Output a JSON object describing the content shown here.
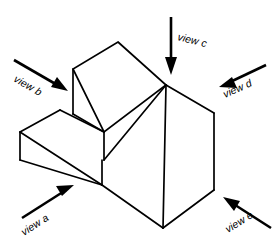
{
  "figure": {
    "background_color": "#ffffff",
    "line_color": "#000000",
    "canvas": {
      "width": 278,
      "height": 249
    }
  },
  "labels": {
    "view_a": "view a",
    "view_b": "view b",
    "view_c": "view c",
    "view_d": "view d",
    "view_e": "view e"
  },
  "arrows": [
    {
      "id": "view-a",
      "label": "view a",
      "direction": "up-right",
      "tail": {
        "x": 22,
        "y": 218
      },
      "tip": {
        "x": 72,
        "y": 186
      },
      "label_rotation_deg": -33,
      "label_x": 24,
      "label_y": 236
    },
    {
      "id": "view-b",
      "label": "view b",
      "direction": "down-right",
      "tail": {
        "x": 14,
        "y": 60
      },
      "tip": {
        "x": 66,
        "y": 90
      },
      "label_rotation_deg": 30,
      "label_x": 13,
      "label_y": 81
    },
    {
      "id": "view-c",
      "label": "view c",
      "direction": "down",
      "tail": {
        "x": 171,
        "y": 17
      },
      "tip": {
        "x": 171,
        "y": 72
      },
      "label_rotation_deg": 14,
      "label_x": 177,
      "label_y": 40
    },
    {
      "id": "view-d",
      "label": "view d",
      "direction": "down-left",
      "tail": {
        "x": 266,
        "y": 65
      },
      "tip": {
        "x": 221,
        "y": 86
      },
      "label_rotation_deg": -24,
      "label_x": 225,
      "label_y": 98
    },
    {
      "id": "view-e",
      "label": "view e",
      "direction": "up-left",
      "tail": {
        "x": 271,
        "y": 228
      },
      "tip": {
        "x": 225,
        "y": 198
      },
      "label_rotation_deg": -32,
      "label_x": 228,
      "label_y": 233
    }
  ],
  "solid": {
    "description": "Two-step isometric block with large inclined ramp face on the right",
    "vertices": {
      "upper_top_back": {
        "x": 118,
        "y": 42
      },
      "upper_top_left": {
        "x": 73,
        "y": 69
      },
      "upper_top_right": {
        "x": 166,
        "y": 85
      },
      "upper_front_left": {
        "x": 73,
        "y": 114
      },
      "upper_front_mid": {
        "x": 104,
        "y": 132
      },
      "lower_top_left": {
        "x": 20,
        "y": 132
      },
      "lower_top_back": {
        "x": 60,
        "y": 110
      },
      "lower_front_left": {
        "x": 20,
        "y": 160
      },
      "lower_front_bottom": {
        "x": 102,
        "y": 185
      },
      "junction": {
        "x": 133,
        "y": 143
      },
      "right_top": {
        "x": 214,
        "y": 113
      },
      "right_bottom": {
        "x": 214,
        "y": 190
      },
      "bottom_front": {
        "x": 163,
        "y": 228
      }
    },
    "faces": [
      "upper step top",
      "upper step left",
      "upper step front",
      "lower step top",
      "lower step left",
      "lower step front",
      "inclined ramp",
      "right side"
    ]
  }
}
